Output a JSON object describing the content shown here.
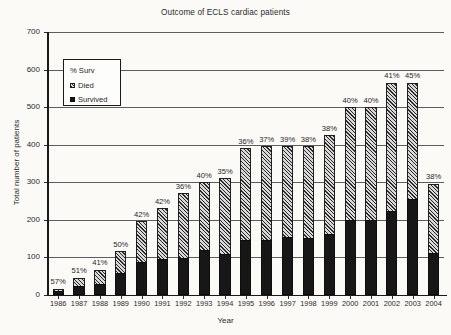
{
  "chart_data": {
    "type": "bar",
    "title": "Outcome of ECLS cardiac patients",
    "xlabel": "Year",
    "ylabel": "Total number of patients",
    "ylim": [
      0,
      700
    ],
    "yticks": [
      0,
      100,
      200,
      300,
      400,
      500,
      600,
      700
    ],
    "grid": true,
    "stacked": true,
    "legend_position": "upper-left-inset",
    "legend": [
      "% Surv",
      "Died",
      "Survived"
    ],
    "categories": [
      "1986",
      "1987",
      "1988",
      "1989",
      "1990",
      "1991",
      "1992",
      "1993",
      "1994",
      "1995",
      "1996",
      "1997",
      "1998",
      "1999",
      "2000",
      "2001",
      "2002",
      "2003",
      "2004"
    ],
    "series": [
      {
        "name": "Survived",
        "values": [
          9,
          23,
          27,
          58,
          88,
          95,
          97,
          120,
          108,
          145,
          146,
          154,
          150,
          162,
          200,
          200,
          222,
          254,
          112
        ]
      },
      {
        "name": "Died",
        "values": [
          7,
          22,
          39,
          58,
          107,
          135,
          173,
          180,
          202,
          245,
          249,
          241,
          245,
          263,
          300,
          300,
          343,
          311,
          183
        ]
      }
    ],
    "totals": [
      16,
      45,
      66,
      116,
      195,
      230,
      270,
      300,
      310,
      390,
      395,
      395,
      395,
      425,
      500,
      500,
      565,
      565,
      295
    ],
    "point_labels": {
      "name": "% Surv",
      "values": [
        "57%",
        "51%",
        "41%",
        "50%",
        "42%",
        "42%",
        "36%",
        "40%",
        "35%",
        "36%",
        "37%",
        "39%",
        "38%",
        "38%",
        "40%",
        "40%",
        "41%",
        "45%",
        "38%"
      ]
    }
  },
  "colors": {
    "survived": "#171717",
    "died_fill": "#d8d8d8",
    "died_hatch": "#2a2a2a",
    "axis": "#1a1a1a",
    "grid": "#5d5d5d",
    "background": "#fbfaf7"
  }
}
